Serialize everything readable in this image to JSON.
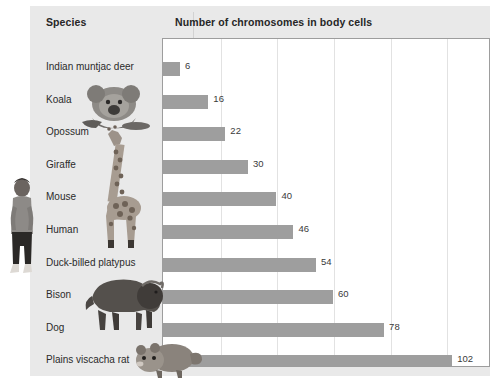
{
  "chart_data": {
    "type": "bar",
    "orientation": "horizontal",
    "title": "Number of chromosomes in body cells",
    "xlabel": "",
    "ylabel": "Species",
    "categories": [
      "Indian muntjac deer",
      "Koala",
      "Opossum",
      "Giraffe",
      "Mouse",
      "Human",
      "Duck-billed platypus",
      "Bison",
      "Dog",
      "Plains viscacha rat"
    ],
    "values": [
      6,
      16,
      22,
      30,
      40,
      46,
      54,
      60,
      78,
      102
    ],
    "xlim": [
      0,
      115
    ],
    "gridlines": [
      20,
      40,
      60,
      80,
      100
    ],
    "grid": true,
    "legend": "none",
    "bar_color": "#9e9e9e",
    "panel_color": "#e9e9e9",
    "plot_background": "#ffffff"
  },
  "table": {
    "header_species": "Species",
    "header_chromosomes": "Number of chromosomes in body cells"
  },
  "rows": [
    {
      "species": "Indian muntjac deer",
      "value": 6,
      "value_label": "6",
      "photo": "none"
    },
    {
      "species": "Koala",
      "value": 16,
      "value_label": "16",
      "photo": "koala-photo"
    },
    {
      "species": "Opossum",
      "value": 22,
      "value_label": "22",
      "photo": "none"
    },
    {
      "species": "Giraffe",
      "value": 30,
      "value_label": "30",
      "photo": "giraffe-photo"
    },
    {
      "species": "Mouse",
      "value": 40,
      "value_label": "40",
      "photo": "none"
    },
    {
      "species": "Human",
      "value": 46,
      "value_label": "46",
      "photo": "human-photo"
    },
    {
      "species": "Duck-billed platypus",
      "value": 54,
      "value_label": "54",
      "photo": "none"
    },
    {
      "species": "Bison",
      "value": 60,
      "value_label": "60",
      "photo": "bison-photo"
    },
    {
      "species": "Dog",
      "value": 78,
      "value_label": "78",
      "photo": "none"
    },
    {
      "species": "Plains viscacha rat",
      "value": 102,
      "value_label": "102",
      "photo": "viscacha-rat-photo"
    }
  ],
  "photos": [
    {
      "name": "koala-photo",
      "alt": "Koala"
    },
    {
      "name": "giraffe-photo",
      "alt": "Giraffe"
    },
    {
      "name": "human-photo",
      "alt": "Human"
    },
    {
      "name": "bison-photo",
      "alt": "Bison"
    },
    {
      "name": "viscacha-rat-photo",
      "alt": "Plains viscacha rat"
    }
  ]
}
